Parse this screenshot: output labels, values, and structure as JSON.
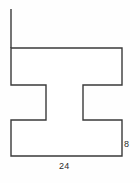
{
  "figure": {
    "kind": "geometry-diagram",
    "shape_name": "i-beam-polygon",
    "stroke_color": "#3a3a3a",
    "fill_color": "#ffffff",
    "background_color": "#fefefe",
    "stroke_width": 1.4,
    "outline_points": "11,48 122,48 122,85 83,85 83,120 122,120 122,156 11,156 11,120 46,120 46,85 11,85",
    "extension_line": {
      "name": "upper-extension-line",
      "x1": 11,
      "y1": 9,
      "x2": 11,
      "y2": 48
    }
  },
  "labels": {
    "height_right": "8",
    "width_bottom": "24"
  }
}
